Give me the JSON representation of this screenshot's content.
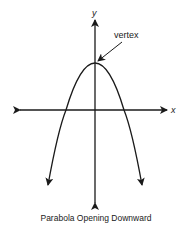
{
  "diagram": {
    "caption": "Parabola Opening Downward",
    "axes": {
      "x_label": "x",
      "y_label": "y"
    },
    "annotations": [
      {
        "label": "vertex",
        "points_to": "vertex"
      }
    ],
    "curve": {
      "type": "parabola",
      "direction": "downward",
      "vertex_on": "y-axis"
    },
    "colors": {
      "stroke": "#1a1a1a",
      "background": "#ffffff"
    }
  }
}
